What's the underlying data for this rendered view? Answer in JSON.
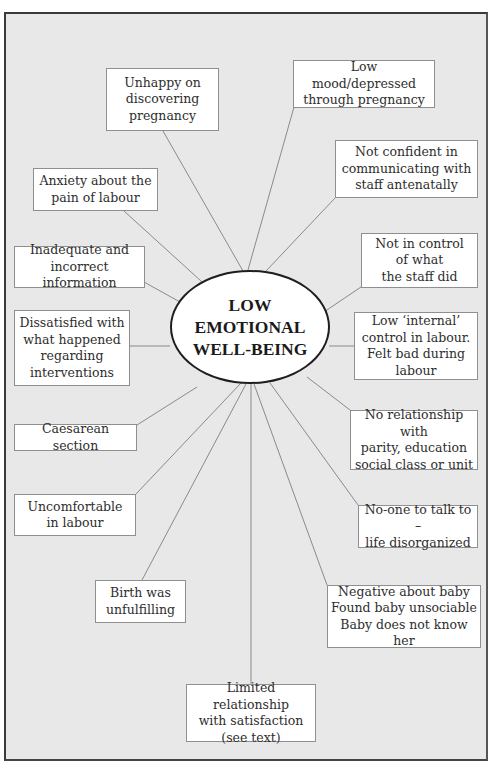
{
  "diagram": {
    "type": "spider-diagram",
    "center": {
      "label": "LOW\nEMOTIONAL\nWELL-BEING"
    },
    "nodes": [
      {
        "id": "unhappy-discovering-pregnancy",
        "label": "Unhappy on\ndiscovering\npregnancy"
      },
      {
        "id": "low-mood-depressed",
        "label": "Low mood/depressed\nthrough pregnancy"
      },
      {
        "id": "not-confident-communicating",
        "label": "Not confident in\ncommunicating with\nstaff antenatally"
      },
      {
        "id": "anxiety-pain-labour",
        "label": "Anxiety about the\npain of labour"
      },
      {
        "id": "not-in-control-staff",
        "label": "Not in control\nof what\nthe staff did"
      },
      {
        "id": "inadequate-information",
        "label": "Inadequate and\nincorrect information"
      },
      {
        "id": "dissatisfied-interventions",
        "label": "Dissatisfied with\nwhat happened\nregarding\ninterventions"
      },
      {
        "id": "low-internal-control",
        "label": "Low ‘internal’\ncontrol in labour.\nFelt bad during\nlabour"
      },
      {
        "id": "no-relationship-parity",
        "label": "No relationship with\nparity, education\nsocial class or unit"
      },
      {
        "id": "caesarean-section",
        "label": "Caesarean section"
      },
      {
        "id": "uncomfortable-labour",
        "label": "Uncomfortable\nin labour"
      },
      {
        "id": "no-one-to-talk-to",
        "label": "No-one to talk to –\nlife disorganized"
      },
      {
        "id": "birth-unfulfilling",
        "label": "Birth was\nunfulfilling"
      },
      {
        "id": "negative-about-baby",
        "label": "Negative about baby\nFound baby unsociable\nBaby does not know her"
      },
      {
        "id": "limited-relationship-satisfaction",
        "label": "Limited relationship\nwith satisfaction\n(see text)"
      }
    ]
  },
  "colors": {
    "background": "#e7e8e7",
    "frame_border": "#3a3a3a",
    "node_fill": "#ffffff",
    "node_border": "#8f8f8f",
    "connector": "#8a8a8a",
    "ellipse_border": "#1e1e1e",
    "text": "#2e2e2e"
  }
}
